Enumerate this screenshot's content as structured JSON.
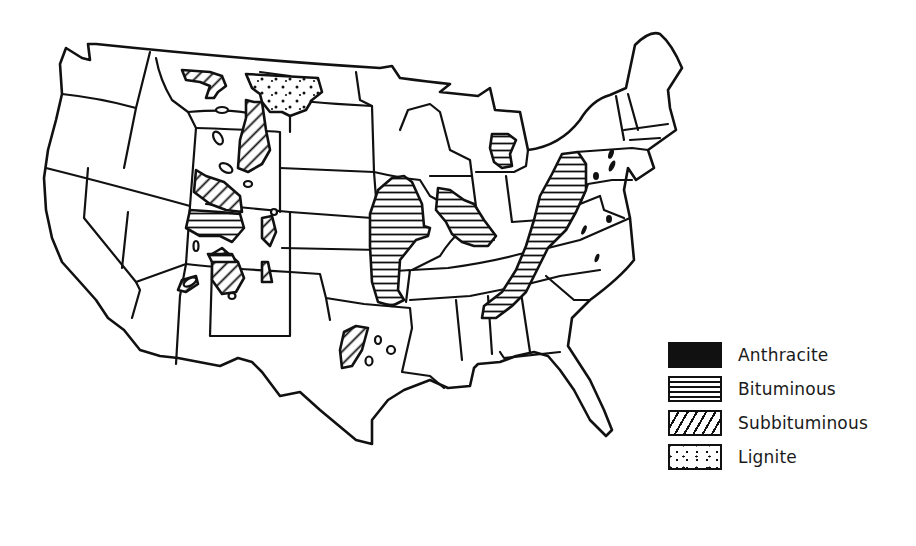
{
  "figure": {
    "map_type": "outline map with state boundaries and patterned coal regions"
  },
  "colors": {
    "ink": "#111111",
    "background": "#ffffff"
  },
  "legend": {
    "items": [
      {
        "key": "anthracite",
        "label": "Anthracite",
        "pattern": "solid-black"
      },
      {
        "key": "bituminous",
        "label": "Bituminous",
        "pattern": "horizontal-lines"
      },
      {
        "key": "subbituminous",
        "label": "Subbituminous",
        "pattern": "diagonal-lines"
      },
      {
        "key": "lignite",
        "label": "Lignite",
        "pattern": "dots"
      }
    ]
  },
  "regions": [
    {
      "name": "Appalachian field",
      "type": "bituminous"
    },
    {
      "name": "Illinois basin",
      "type": "bituminous"
    },
    {
      "name": "Western Interior field",
      "type": "bituminous"
    },
    {
      "name": "Michigan basin",
      "type": "bituminous"
    },
    {
      "name": "Pennsylvania anthracite pockets",
      "type": "anthracite"
    },
    {
      "name": "Virginia / North Carolina pockets",
      "type": "anthracite"
    },
    {
      "name": "Northern Great Plains (Dakotas)",
      "type": "lignite"
    },
    {
      "name": "Powder River basin",
      "type": "subbituminous"
    },
    {
      "name": "Montana subbituminous",
      "type": "subbituminous"
    },
    {
      "name": "Green River / Uinta",
      "type": "subbituminous"
    },
    {
      "name": "San Juan basin",
      "type": "subbituminous"
    },
    {
      "name": "Texas field",
      "type": "subbituminous"
    }
  ]
}
